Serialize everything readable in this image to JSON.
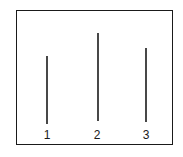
{
  "diagram": {
    "stroke_color": "#1a1a1a",
    "background": "#ffffff",
    "lines": [
      {
        "label": "1",
        "x": 47,
        "y_top": 56,
        "y_bottom": 124
      },
      {
        "label": "2",
        "x": 98,
        "y_top": 33,
        "y_bottom": 121
      },
      {
        "label": "3",
        "x": 146,
        "y_top": 48,
        "y_bottom": 122
      }
    ]
  }
}
